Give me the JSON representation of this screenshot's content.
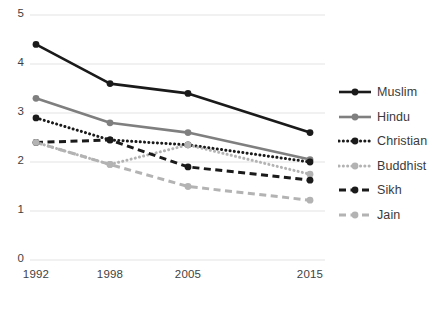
{
  "chart_data": {
    "type": "line",
    "title": "",
    "subtitle": "",
    "xlabel": "",
    "ylabel": "",
    "categories": [
      "1992",
      "1998",
      "2005",
      "2015"
    ],
    "x": [
      1992,
      1998,
      2005,
      2015
    ],
    "ylim": [
      0,
      5
    ],
    "yticks": [
      0,
      1,
      2,
      3,
      4,
      5
    ],
    "ytick_labels": [
      "0",
      "1",
      "2",
      "3",
      "4",
      "5"
    ],
    "xtick_labels": [
      "1992",
      "1998",
      "2005",
      "2015"
    ],
    "grid": "horizontal",
    "legend_position": "right",
    "series": [
      {
        "name": "Muslim",
        "values": [
          4.4,
          3.6,
          3.4,
          2.6
        ],
        "color": "#1a1a1a",
        "style": "solid",
        "marker": "circle"
      },
      {
        "name": "Hindu",
        "values": [
          3.3,
          2.8,
          2.6,
          2.05
        ],
        "color": "#7f7f7f",
        "style": "solid",
        "marker": "circle"
      },
      {
        "name": "Christian",
        "values": [
          2.9,
          2.45,
          2.35,
          2.0
        ],
        "color": "#1a1a1a",
        "style": "dotted",
        "marker": "circle"
      },
      {
        "name": "Buddhist",
        "values": [
          2.4,
          1.95,
          2.35,
          1.75
        ],
        "color": "#b3b3b3",
        "style": "dotted",
        "marker": "circle"
      },
      {
        "name": "Sikh",
        "values": [
          2.4,
          2.45,
          1.9,
          1.63
        ],
        "color": "#1a1a1a",
        "style": "dashed",
        "marker": "circle"
      },
      {
        "name": "Jain",
        "values": [
          2.4,
          1.95,
          1.5,
          1.22
        ],
        "color": "#b3b3b3",
        "style": "dashed",
        "marker": "circle"
      }
    ]
  },
  "legend": {
    "items": [
      {
        "label": "Muslim"
      },
      {
        "label": "Hindu"
      },
      {
        "label": "Christian"
      },
      {
        "label": "Buddhist"
      },
      {
        "label": "Sikh"
      },
      {
        "label": "Jain"
      }
    ]
  },
  "colors": {
    "grid": "#ededed",
    "text": "#3f3f3f",
    "dark": "#1a1a1a",
    "mid_gray": "#7f7f7f",
    "light_gray": "#b3b3b3",
    "background": "#ffffff"
  }
}
